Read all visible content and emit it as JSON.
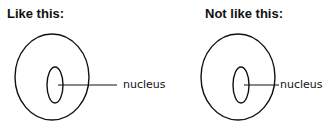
{
  "panels": [
    {
      "heading": "Like this:",
      "label": "nucleus",
      "correct": true
    },
    {
      "heading": "Not like this:",
      "label": "nucleus",
      "correct": false
    }
  ],
  "colors": {
    "stroke": "#111111",
    "background": "#ffffff"
  }
}
